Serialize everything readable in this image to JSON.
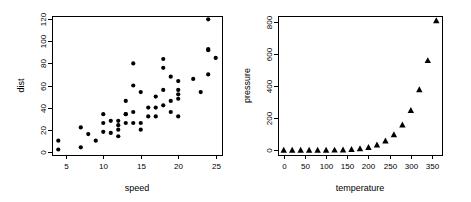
{
  "figure": {
    "background": "#ffffff",
    "foreground": "#000000",
    "panels": 2,
    "layout": "1 row x 2 columns"
  },
  "chart_data": [
    {
      "type": "scatter",
      "title": "",
      "xlabel": "speed",
      "ylabel": "dist",
      "marker": "filled-circle",
      "marker_color": "#000000",
      "grid": false,
      "legend": null,
      "xlim": [
        3.16,
        25.84
      ],
      "ylim": [
        -3.0,
        123.0
      ],
      "xticks": [
        5,
        10,
        15,
        20,
        25
      ],
      "yticks": [
        0,
        20,
        40,
        60,
        80,
        100,
        120
      ],
      "xticklabels": [
        "5",
        "10",
        "15",
        "20",
        "25"
      ],
      "yticklabels": [
        "0",
        "20",
        "40",
        "60",
        "80",
        "100",
        "120"
      ],
      "n": 50,
      "x": [
        4,
        4,
        7,
        7,
        8,
        9,
        10,
        10,
        10,
        11,
        11,
        12,
        12,
        12,
        12,
        13,
        13,
        13,
        13,
        14,
        14,
        14,
        14,
        15,
        15,
        15,
        16,
        16,
        17,
        17,
        17,
        18,
        18,
        18,
        18,
        19,
        19,
        19,
        20,
        20,
        20,
        20,
        20,
        22,
        23,
        24,
        24,
        24,
        24,
        25
      ],
      "y": [
        2,
        10,
        4,
        22,
        16,
        10,
        18,
        26,
        34,
        17,
        28,
        14,
        20,
        24,
        28,
        26,
        34,
        34,
        46,
        26,
        36,
        60,
        80,
        20,
        26,
        54,
        32,
        40,
        32,
        40,
        50,
        42,
        56,
        76,
        84,
        36,
        46,
        68,
        32,
        48,
        52,
        56,
        64,
        66,
        54,
        70,
        92,
        93,
        120,
        85
      ]
    },
    {
      "type": "scatter",
      "title": "",
      "xlabel": "temperature",
      "ylabel": "pressure",
      "marker": "filled-triangle",
      "marker_color": "#000000",
      "grid": false,
      "legend": null,
      "xlim": [
        -13.5,
        373.5
      ],
      "ylim": [
        -29.3,
        836.0
      ],
      "xticks": [
        0,
        50,
        100,
        150,
        200,
        250,
        300,
        350
      ],
      "yticks": [
        0,
        200,
        400,
        600,
        800
      ],
      "xticklabels": [
        "0",
        "50",
        "100",
        "150",
        "200",
        "250",
        "300",
        "350"
      ],
      "yticklabels": [
        "0",
        "200",
        "400",
        "600",
        "800"
      ],
      "n": 19,
      "x": [
        0,
        20,
        40,
        60,
        80,
        100,
        120,
        140,
        160,
        180,
        200,
        220,
        240,
        260,
        280,
        300,
        320,
        340,
        360
      ],
      "y": [
        0.0002,
        0.0012,
        0.006,
        0.03,
        0.09,
        0.27,
        0.75,
        1.85,
        4.2,
        8.8,
        17.3,
        32.1,
        57,
        96,
        157,
        247,
        376,
        558,
        806
      ]
    }
  ]
}
